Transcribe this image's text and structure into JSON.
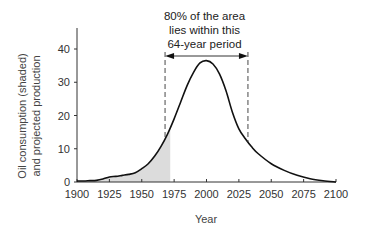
{
  "chart_data": {
    "type": "area",
    "title": "",
    "xlabel": "Year",
    "ylabel_lines": [
      "Oil consumption (shaded)",
      "and projected production"
    ],
    "xlim": [
      1900,
      2100
    ],
    "ylim": [
      0,
      45
    ],
    "x_ticks": [
      1900,
      1925,
      1950,
      1975,
      2000,
      2025,
      2050,
      2075,
      2100
    ],
    "y_ticks": [
      0,
      10,
      20,
      30,
      40
    ],
    "grid": false,
    "series": [
      {
        "name": "Projected production curve",
        "x": [
          1900,
          1905,
          1910,
          1915,
          1920,
          1925,
          1930,
          1935,
          1940,
          1945,
          1950,
          1955,
          1960,
          1965,
          1970,
          1975,
          1980,
          1985,
          1990,
          1995,
          2000,
          2005,
          2010,
          2015,
          2020,
          2025,
          2030,
          2035,
          2040,
          2050,
          2060,
          2070,
          2080,
          2090,
          2100
        ],
        "values": [
          0.3,
          0.3,
          0.4,
          0.5,
          0.9,
          1.5,
          1.7,
          2.0,
          2.3,
          2.8,
          4.0,
          5.5,
          7.8,
          10.8,
          14.5,
          19.0,
          24.0,
          29.0,
          33.0,
          35.8,
          36.5,
          35.5,
          32.5,
          27.5,
          21.0,
          16.0,
          13.0,
          10.5,
          8.5,
          5.5,
          3.5,
          2.0,
          1.0,
          0.4,
          0.0
        ]
      },
      {
        "name": "Oil consumption (shaded)",
        "x_range": [
          1900,
          1972
        ]
      }
    ],
    "annotations": [
      {
        "text_lines": [
          "80% of the area",
          "lies within this",
          "64-year period"
        ],
        "span": [
          1968,
          2032
        ],
        "style": "dashed vertical lines with double-headed arrow"
      }
    ]
  }
}
